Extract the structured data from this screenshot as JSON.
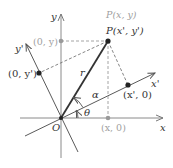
{
  "diagram": {
    "colors": {
      "axis": "#8a8a8a",
      "rotated_axis": "#5a5a5a",
      "radius": "#333333",
      "dashed": "#9a9a9a",
      "point": "#222222",
      "gray_point": "#9a9a9a",
      "gray_text": "#a0a0a0",
      "text": "#333333"
    },
    "labels": {
      "y_axis": "y",
      "x_axis": "x",
      "y_prime_axis": "y'",
      "x_prime_axis": "x'",
      "origin": "O",
      "point_old": "P(x, y)",
      "point_new": "P(x', y')",
      "point_0_y": "(0, y)",
      "point_x_0": "(x, 0)",
      "point_0_yprime": "(0, y')",
      "point_xprime_0": "(x', 0)",
      "radius": "r",
      "angle_alpha": "α",
      "angle_theta": "θ"
    }
  }
}
